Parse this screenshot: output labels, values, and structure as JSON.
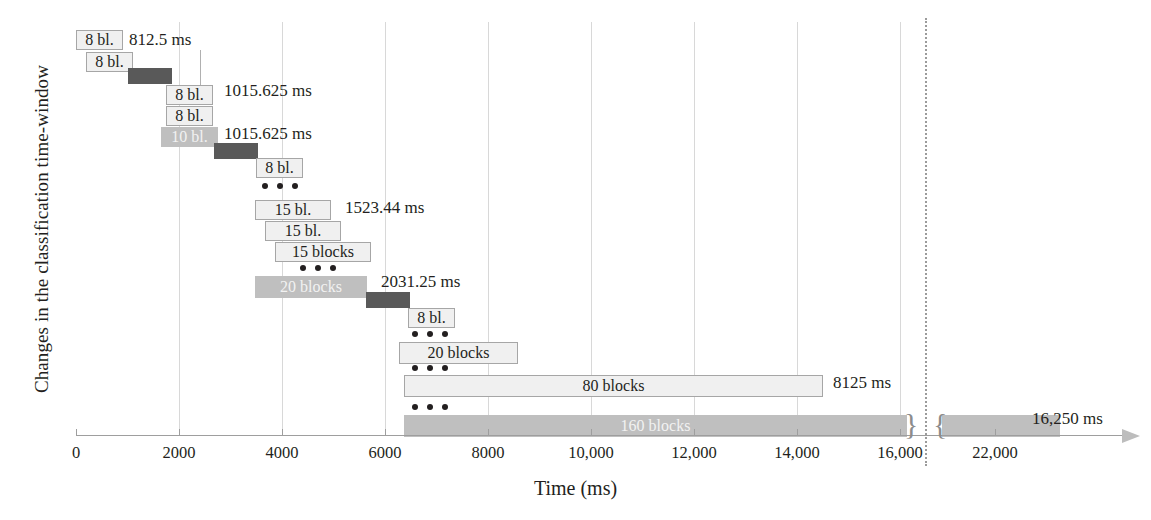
{
  "axes": {
    "y_title": "Changes in the classification time-window",
    "x_title": "Time (ms)",
    "x_ticks": [
      "0",
      "2000",
      "4000",
      "6000",
      "8000",
      "10,000",
      "12,000",
      "14,000",
      "16,000",
      "22,000"
    ]
  },
  "chart_data": {
    "type": "bar",
    "title": "",
    "xlabel": "Time (ms)",
    "ylabel": "Changes in the classification time-window",
    "xlim": [
      0,
      16600
    ],
    "grid": true,
    "legend": null,
    "axis_break": {
      "after": 16600,
      "resumes_at": 21000,
      "label": "dotted divider before 22,000"
    },
    "x_ticks": [
      0,
      2000,
      4000,
      6000,
      8000,
      10000,
      12000,
      14000,
      16000,
      22000
    ],
    "bars": [
      {
        "row": 0,
        "label": "8 bl.",
        "start_ms": 0,
        "end_ms": 812.5,
        "style": "light"
      },
      {
        "row": 1,
        "label": "8 bl.",
        "start_ms": 203,
        "end_ms": 1015.5,
        "style": "light"
      },
      {
        "row": 2,
        "label": "",
        "start_ms": 1015,
        "end_ms": 1828,
        "style": "dark"
      },
      {
        "row": 3,
        "label": "8 bl.",
        "start_ms": 2030,
        "end_ms": 2843,
        "style": "light"
      },
      {
        "row": 4,
        "label": "8 bl.",
        "start_ms": 2234,
        "end_ms": 3046,
        "style": "light"
      },
      {
        "row": 5,
        "label": "10 bl.",
        "start_ms": 2234,
        "end_ms": 3250,
        "style": "mid"
      },
      {
        "row": 6,
        "label": "",
        "start_ms": 3046,
        "end_ms": 3858,
        "style": "dark"
      },
      {
        "row": 7,
        "label": "8 bl.",
        "start_ms": 3656,
        "end_ms": 4468,
        "style": "light"
      },
      {
        "row": 9,
        "label": "15 bl.",
        "start_ms": 3453,
        "end_ms": 4976,
        "style": "light"
      },
      {
        "row": 10,
        "label": "15 bl.",
        "start_ms": 3656,
        "end_ms": 5179,
        "style": "light"
      },
      {
        "row": 11,
        "label": "15 blocks",
        "start_ms": 3859,
        "end_ms": 5382,
        "style": "light"
      },
      {
        "row": 13,
        "label": "20 blocks",
        "start_ms": 3453,
        "end_ms": 5625,
        "style": "mid"
      },
      {
        "row": 14,
        "label": "",
        "start_ms": 5625,
        "end_ms": 6437,
        "style": "dark"
      },
      {
        "row": 15,
        "label": "8 bl.",
        "start_ms": 6437,
        "end_ms": 7250,
        "style": "light"
      },
      {
        "row": 17,
        "label": "20 blocks",
        "start_ms": 6250,
        "end_ms": 8281,
        "style": "light"
      },
      {
        "row": 19,
        "label": "80 blocks",
        "start_ms": 6375,
        "end_ms": 14500,
        "style": "light"
      },
      {
        "row": 21,
        "label": "160 blocks",
        "start_ms": 6375,
        "end_ms": 16600,
        "style": "mid"
      },
      {
        "row": 21,
        "label": "",
        "start_ms": 21200,
        "end_ms": 23500,
        "style": "mid",
        "continuation": true
      }
    ],
    "annotations": [
      {
        "text": "812.5 ms",
        "at_ms": 812.5,
        "row": 0
      },
      {
        "text": "1015.625 ms",
        "at_ms": 1015.6,
        "row": 3
      },
      {
        "text": "1015.625 ms",
        "at_ms": 1015.6,
        "row": 5
      },
      {
        "text": "1523.44 ms",
        "at_ms": 1523.4,
        "row": 9
      },
      {
        "text": "2031.25 ms",
        "at_ms": 2031.3,
        "row": 13
      },
      {
        "text": "8125 ms",
        "at_ms": 8125,
        "row": 19
      },
      {
        "text": "16,250 ms",
        "at_ms": 16250,
        "row": 21
      }
    ],
    "ellipsis_rows": [
      8,
      12,
      16,
      18,
      20
    ]
  },
  "bars": [
    {
      "name": "bar-8bl-r1",
      "label": "8 bl.",
      "x": 76,
      "w": 47,
      "y": 30,
      "h": 20,
      "style": "light"
    },
    {
      "name": "bar-8bl-r2",
      "label": "8 bl.",
      "x": 86,
      "w": 47,
      "y": 52,
      "h": 20,
      "style": "light"
    },
    {
      "name": "bar-dark-r3",
      "label": "",
      "x": 128,
      "w": 44,
      "y": 68,
      "h": 16,
      "style": "dark"
    },
    {
      "name": "bar-8bl-r4",
      "label": "8 bl.",
      "x": 166,
      "w": 47,
      "y": 85,
      "h": 20,
      "style": "light"
    },
    {
      "name": "bar-8bl-r5",
      "label": "8 bl.",
      "x": 166,
      "w": 47,
      "y": 106,
      "h": 20,
      "style": "light"
    },
    {
      "name": "bar-10bl-r6",
      "label": "10 bl.",
      "x": 161,
      "w": 57,
      "y": 127,
      "h": 20,
      "style": "mid"
    },
    {
      "name": "bar-dark-r7",
      "label": "",
      "x": 214,
      "w": 44,
      "y": 143,
      "h": 16,
      "style": "dark"
    },
    {
      "name": "bar-8bl-r8",
      "label": "8 bl.",
      "x": 256,
      "w": 47,
      "y": 158,
      "h": 20,
      "style": "light"
    },
    {
      "name": "bar-15bl-r10",
      "label": "15 bl.",
      "x": 255,
      "w": 76,
      "y": 200,
      "h": 20,
      "style": "light"
    },
    {
      "name": "bar-15bl-r11",
      "label": "15 bl.",
      "x": 265,
      "w": 76,
      "y": 221,
      "h": 20,
      "style": "light"
    },
    {
      "name": "bar-15blocks-r12",
      "label": "15 blocks",
      "x": 275,
      "w": 96,
      "y": 242,
      "h": 20,
      "style": "light"
    },
    {
      "name": "bar-20blocks-r14",
      "label": "20 blocks",
      "x": 255,
      "w": 112,
      "y": 276,
      "h": 22,
      "style": "mid"
    },
    {
      "name": "bar-dark-r15",
      "label": "",
      "x": 366,
      "w": 44,
      "y": 292,
      "h": 16,
      "style": "dark"
    },
    {
      "name": "bar-8bl-r16",
      "label": "8 bl.",
      "x": 408,
      "w": 47,
      "y": 308,
      "h": 20,
      "style": "light"
    },
    {
      "name": "bar-20blocks-r18",
      "label": "20 blocks",
      "x": 399,
      "w": 119,
      "y": 342,
      "h": 22,
      "style": "light"
    },
    {
      "name": "bar-80blocks-r20",
      "label": "80 blocks",
      "x": 404,
      "w": 419,
      "y": 375,
      "h": 22,
      "style": "light"
    },
    {
      "name": "bar-160blocks-r22",
      "label": "160 blocks",
      "x": 404,
      "w": 503,
      "y": 415,
      "h": 22,
      "style": "mid"
    },
    {
      "name": "bar-160blocks-cont",
      "label": "",
      "x": 942,
      "w": 118,
      "y": 415,
      "h": 22,
      "style": "mid"
    }
  ],
  "dots": [
    {
      "name": "ellipsis-1",
      "x": 262,
      "y": 183
    },
    {
      "name": "ellipsis-2",
      "x": 300,
      "y": 265
    },
    {
      "name": "ellipsis-3",
      "x": 412,
      "y": 331
    },
    {
      "name": "ellipsis-4",
      "x": 412,
      "y": 365
    },
    {
      "name": "ellipsis-5",
      "x": 412,
      "y": 404
    }
  ],
  "callouts": [
    {
      "name": "callout-812-5ms",
      "text": "812.5 ms",
      "x": 129,
      "y": 30,
      "leader_x": 200,
      "leader_y": 50,
      "leader_h": 35
    },
    {
      "name": "callout-1015-625ms-a",
      "text": "1015.625 ms",
      "x": 224,
      "y": 81,
      "leader_x": 0,
      "leader_y": 0,
      "leader_h": 0
    },
    {
      "name": "callout-1015-625ms-b",
      "text": "1015.625 ms",
      "x": 224,
      "y": 124,
      "leader_x": 0,
      "leader_y": 0,
      "leader_h": 0
    },
    {
      "name": "callout-1523-44ms",
      "text": "1523.44 ms",
      "x": 345,
      "y": 198,
      "leader_x": 0,
      "leader_y": 0,
      "leader_h": 0
    },
    {
      "name": "callout-2031-25ms",
      "text": "2031.25 ms",
      "x": 381,
      "y": 272,
      "leader_x": 0,
      "leader_y": 0,
      "leader_h": 0
    },
    {
      "name": "callout-8125ms",
      "text": "8125 ms",
      "x": 833,
      "y": 373,
      "leader_x": 0,
      "leader_y": 0,
      "leader_h": 0
    },
    {
      "name": "callout-16250ms",
      "text": "16,250 ms",
      "x": 1032,
      "y": 409,
      "leader_x": 0,
      "leader_y": 0,
      "leader_h": 0
    }
  ],
  "gridlines": [
    {
      "name": "gridline-2000",
      "x": 179
    },
    {
      "name": "gridline-4000",
      "x": 282
    },
    {
      "name": "gridline-6000",
      "x": 385
    },
    {
      "name": "gridline-8000",
      "x": 488
    },
    {
      "name": "gridline-10000",
      "x": 591
    },
    {
      "name": "gridline-12000",
      "x": 694
    },
    {
      "name": "gridline-14000",
      "x": 797
    },
    {
      "name": "gridline-16000",
      "x": 900
    }
  ],
  "ticks": [
    {
      "name": "tick-0",
      "x": 76,
      "label": "0"
    },
    {
      "name": "tick-2000",
      "x": 179,
      "label": "2000"
    },
    {
      "name": "tick-4000",
      "x": 282,
      "label": "4000"
    },
    {
      "name": "tick-6000",
      "x": 385,
      "label": "6000"
    },
    {
      "name": "tick-8000",
      "x": 488,
      "label": "8000"
    },
    {
      "name": "tick-10000",
      "x": 591,
      "label": "10,000"
    },
    {
      "name": "tick-12000",
      "x": 694,
      "label": "12,000"
    },
    {
      "name": "tick-14000",
      "x": 797,
      "label": "14,000"
    },
    {
      "name": "tick-16000",
      "x": 900,
      "label": "16,000"
    },
    {
      "name": "tick-22000",
      "x": 995,
      "label": "22,000"
    }
  ],
  "break": {
    "x": 925,
    "left_brace": "}",
    "right_brace": "{"
  }
}
